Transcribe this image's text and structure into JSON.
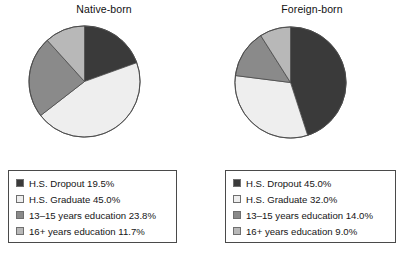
{
  "figure": {
    "background": "#ffffff",
    "palette": {
      "hs_dropout": "#3a3a3a",
      "hs_graduate": "#eeeeee",
      "years_13_15": "#8a8a8a",
      "years_16_plus": "#b8b8b8",
      "outline": "#4a4a4a"
    }
  },
  "chart_data": [
    {
      "type": "pie",
      "title": "Native-born",
      "labels": [
        "H.S. Dropout",
        "H.S. Graduate",
        "13–15 years education",
        "16+ years education"
      ],
      "values": [
        19.5,
        45.0,
        23.8,
        11.7
      ],
      "value_suffix": "%",
      "colors": [
        "#3a3a3a",
        "#eeeeee",
        "#8a8a8a",
        "#b8b8b8"
      ],
      "start_angle": 90,
      "direction": "clockwise",
      "legend": {
        "position": "below",
        "entries": [
          {
            "swatch": "#3a3a3a",
            "text": "H.S. Dropout 19.5%"
          },
          {
            "swatch": "#eeeeee",
            "text": "H.S. Graduate 45.0%"
          },
          {
            "swatch": "#8a8a8a",
            "text": "13–15 years education 23.8%"
          },
          {
            "swatch": "#b8b8b8",
            "text": "16+ years education 11.7%"
          }
        ]
      }
    },
    {
      "type": "pie",
      "title": "Foreign-born",
      "labels": [
        "H.S. Dropout",
        "H.S. Graduate",
        "13–15 years education",
        "16+ years education"
      ],
      "values": [
        45.0,
        32.0,
        14.0,
        9.0
      ],
      "value_suffix": "%",
      "colors": [
        "#3a3a3a",
        "#eeeeee",
        "#8a8a8a",
        "#b8b8b8"
      ],
      "start_angle": 90,
      "direction": "clockwise",
      "legend": {
        "position": "below",
        "entries": [
          {
            "swatch": "#3a3a3a",
            "text": "H.S. Dropout 45.0%"
          },
          {
            "swatch": "#eeeeee",
            "text": "H.S. Graduate 32.0%"
          },
          {
            "swatch": "#8a8a8a",
            "text": "13–15 years education 14.0%"
          },
          {
            "swatch": "#b8b8b8",
            "text": "16+ years education 9.0%"
          }
        ]
      }
    }
  ]
}
